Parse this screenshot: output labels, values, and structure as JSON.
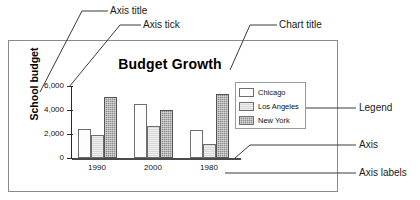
{
  "chart_data": {
    "type": "bar",
    "title": "Budget Growth",
    "xlabel": "",
    "ylabel": "School budget",
    "categories": [
      "1990",
      "2000",
      "1980"
    ],
    "series": [
      {
        "name": "Chicago",
        "values": [
          2400,
          4500,
          2300
        ],
        "color": "#fdfdfd"
      },
      {
        "name": "Los Angeles",
        "values": [
          1900,
          2650,
          1150
        ],
        "color": "#d9d9d9"
      },
      {
        "name": "New York",
        "values": [
          5100,
          4000,
          5300
        ],
        "color": "#8d8d8d"
      }
    ],
    "ylim": [
      0,
      6000
    ],
    "yticks": [
      0,
      2000,
      4000,
      6000
    ],
    "ytick_labels": [
      "0",
      "2,000",
      "4,000",
      "6,000"
    ],
    "grid": false,
    "legend_position": "inside-right"
  },
  "annotations": [
    {
      "id": "axis-title",
      "label": "Axis title"
    },
    {
      "id": "axis-tick",
      "label": "Axis tick"
    },
    {
      "id": "chart-title",
      "label": "Chart title"
    },
    {
      "id": "legend",
      "label": "Legend"
    },
    {
      "id": "axis",
      "label": "Axis"
    },
    {
      "id": "axis-labels",
      "label": "Axis labels"
    }
  ],
  "colors": {
    "frame": "#8a8a8a",
    "axis": "#2b2b2b",
    "callout_line": "#3a3a3a",
    "text": "#1a1a1a"
  }
}
